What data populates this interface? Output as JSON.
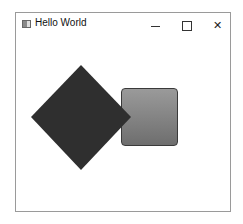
{
  "window": {
    "title": "Hello World",
    "controls": {
      "minimize": "minimize",
      "maximize": "maximize",
      "close": "✕"
    }
  },
  "shapes": {
    "diamond": {
      "fill": "#2f2f2f"
    },
    "square": {
      "gradient_top": "#9a9a9a",
      "gradient_bottom": "#6e6e6e",
      "border": "#3a3a3a"
    }
  }
}
